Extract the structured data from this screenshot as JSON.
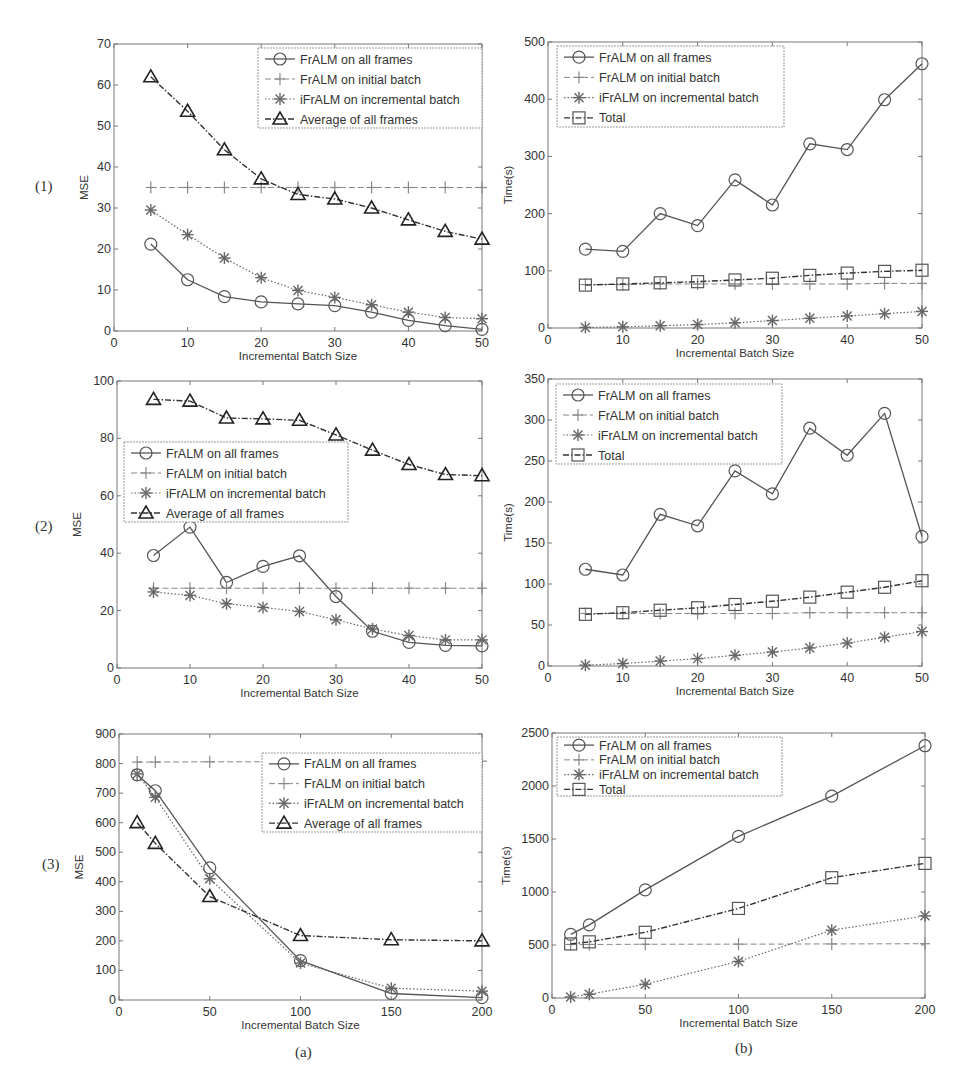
{
  "figure": {
    "row_labels": [
      "(1)",
      "(2)",
      "(3)"
    ],
    "column_labels": [
      "(a)",
      "(b)"
    ]
  },
  "legends": {
    "mse": [
      "FrALM on all frames",
      "FrALM on initial batch",
      "iFrALM on incremental batch",
      "Average of all frames"
    ],
    "time": [
      "FrALM on all frames",
      "FrALM on initial batch",
      "iFrALM on incremental batch",
      "Total"
    ]
  },
  "chart_data": [
    {
      "id": "row1-a",
      "type": "line",
      "title": "",
      "xlabel": "Incremental Batch Size",
      "ylabel": "MSE",
      "xlim": [
        0,
        50
      ],
      "ylim": [
        0,
        70
      ],
      "xticks": [
        0,
        10,
        20,
        30,
        40,
        50
      ],
      "yticks": [
        0,
        10,
        20,
        30,
        40,
        50,
        60,
        70
      ],
      "grid": false,
      "legend_position": "upper right",
      "x": [
        5,
        10,
        15,
        20,
        25,
        30,
        35,
        40,
        45,
        50
      ],
      "series": [
        {
          "name": "FrALM on all frames",
          "marker": "circle",
          "style": "solid",
          "values": [
            21.2,
            12.5,
            8.4,
            7.1,
            6.6,
            6.2,
            4.6,
            2.6,
            1.3,
            0.4
          ]
        },
        {
          "name": "FrALM on initial batch",
          "marker": "plus",
          "style": "dashed",
          "values": [
            35,
            35,
            35,
            35,
            35,
            35,
            35,
            35,
            35,
            35
          ]
        },
        {
          "name": "iFrALM on incremental batch",
          "marker": "star",
          "style": "dotted",
          "values": [
            29.5,
            23.5,
            17.8,
            13.0,
            9.9,
            8.2,
            6.4,
            4.6,
            3.3,
            3.0
          ]
        },
        {
          "name": "Average of all frames",
          "marker": "triangle",
          "style": "dashdot",
          "values": [
            62.0,
            53.6,
            44.2,
            37.1,
            33.3,
            32.2,
            30.0,
            27.1,
            24.3,
            22.4
          ]
        }
      ]
    },
    {
      "id": "row1-b",
      "type": "line",
      "title": "",
      "xlabel": "Incremental Batch Size",
      "ylabel": "Time(s)",
      "xlim": [
        0,
        50
      ],
      "ylim": [
        0,
        500
      ],
      "xticks": [
        0,
        10,
        20,
        30,
        40,
        50
      ],
      "yticks": [
        0,
        100,
        200,
        300,
        400,
        500
      ],
      "grid": false,
      "legend_position": "upper left",
      "x": [
        5,
        10,
        15,
        20,
        25,
        30,
        35,
        40,
        45,
        50
      ],
      "series": [
        {
          "name": "FrALM on all frames",
          "marker": "circle",
          "style": "solid",
          "values": [
            138,
            134,
            200,
            179,
            259,
            215,
            322,
            312,
            399,
            462
          ]
        },
        {
          "name": "FrALM on initial batch",
          "marker": "plus",
          "style": "dashed",
          "values": [
            76,
            76,
            77,
            77,
            77,
            77,
            77,
            77,
            78,
            78
          ]
        },
        {
          "name": "iFrALM on incremental batch",
          "marker": "star",
          "style": "dotted",
          "values": [
            1,
            2,
            4,
            6,
            9,
            13,
            17,
            21,
            25,
            29
          ]
        },
        {
          "name": "Total",
          "marker": "square",
          "style": "dashdot",
          "values": [
            75,
            77,
            79,
            81,
            84,
            87,
            92,
            96,
            99,
            101
          ]
        }
      ]
    },
    {
      "id": "row2-a",
      "type": "line",
      "title": "",
      "xlabel": "Incremental Batch Size",
      "ylabel": "MSE",
      "xlim": [
        0,
        50
      ],
      "ylim": [
        0,
        100
      ],
      "xticks": [
        0,
        10,
        20,
        30,
        40,
        50
      ],
      "yticks": [
        0,
        20,
        40,
        60,
        80,
        100
      ],
      "grid": false,
      "legend_position": "center left",
      "x": [
        5,
        10,
        15,
        20,
        25,
        30,
        35,
        40,
        45,
        50
      ],
      "series": [
        {
          "name": "FrALM on all frames",
          "marker": "circle",
          "style": "solid",
          "values": [
            39.2,
            49.1,
            29.8,
            35.4,
            39.1,
            24.9,
            12.8,
            8.9,
            7.9,
            7.7
          ]
        },
        {
          "name": "FrALM on initial batch",
          "marker": "plus",
          "style": "dashed",
          "values": [
            27.8,
            27.8,
            27.8,
            27.8,
            27.8,
            27.8,
            27.8,
            27.8,
            27.8,
            27.8
          ]
        },
        {
          "name": "iFrALM on incremental batch",
          "marker": "star",
          "style": "dotted",
          "values": [
            26.5,
            25.3,
            22.4,
            21.1,
            19.7,
            16.8,
            13.6,
            11.3,
            9.8,
            9.8
          ]
        },
        {
          "name": "Average of all frames",
          "marker": "triangle",
          "style": "dashdot",
          "values": [
            93.6,
            93.0,
            87.1,
            86.8,
            86.3,
            81.2,
            75.9,
            70.9,
            67.4,
            67.0
          ]
        }
      ]
    },
    {
      "id": "row2-b",
      "type": "line",
      "title": "",
      "xlabel": "Incremental Batch Size",
      "ylabel": "Time(s)",
      "xlim": [
        0,
        50
      ],
      "ylim": [
        0,
        350
      ],
      "xticks": [
        0,
        10,
        20,
        30,
        40,
        50
      ],
      "yticks": [
        0,
        50,
        100,
        150,
        200,
        250,
        300,
        350
      ],
      "grid": false,
      "legend_position": "upper left",
      "x": [
        5,
        10,
        15,
        20,
        25,
        30,
        35,
        40,
        45,
        50
      ],
      "series": [
        {
          "name": "FrALM on all frames",
          "marker": "circle",
          "style": "solid",
          "values": [
            118,
            111,
            185,
            171,
            238,
            210,
            290,
            257,
            308,
            158
          ]
        },
        {
          "name": "FrALM on initial batch",
          "marker": "plus",
          "style": "dashed",
          "values": [
            64,
            64,
            64,
            64,
            64,
            64,
            65,
            65,
            65,
            65
          ]
        },
        {
          "name": "iFrALM on incremental batch",
          "marker": "star",
          "style": "dotted",
          "values": [
            1,
            3,
            6,
            9,
            13,
            17,
            22,
            28,
            35,
            42
          ]
        },
        {
          "name": "Total",
          "marker": "square",
          "style": "dashdot",
          "values": [
            63,
            65,
            68,
            71,
            75,
            79,
            84,
            90,
            96,
            104
          ]
        }
      ]
    },
    {
      "id": "row3-a",
      "type": "line",
      "title": "",
      "xlabel": "Incremental Batch Size",
      "ylabel": "MSE",
      "xlim": [
        0,
        200
      ],
      "ylim": [
        0,
        900
      ],
      "xticks": [
        0,
        50,
        100,
        150,
        200
      ],
      "yticks": [
        0,
        100,
        200,
        300,
        400,
        500,
        600,
        700,
        800,
        900
      ],
      "grid": false,
      "legend_position": "upper right",
      "x": [
        10,
        20,
        50,
        100,
        150,
        200
      ],
      "series": [
        {
          "name": "FrALM on all frames",
          "marker": "circle",
          "style": "solid",
          "values": [
            762,
            708,
            447,
            133,
            22,
            8
          ]
        },
        {
          "name": "FrALM on initial batch",
          "marker": "plus",
          "style": "dashed",
          "values": [
            805,
            805,
            806,
            806,
            807,
            808
          ]
        },
        {
          "name": "iFrALM on incremental batch",
          "marker": "star",
          "style": "dotted",
          "values": [
            765,
            686,
            410,
            125,
            40,
            30
          ]
        },
        {
          "name": "Average of all frames",
          "marker": "triangle",
          "style": "dashdot",
          "values": [
            600,
            530,
            350,
            218,
            204,
            200
          ]
        }
      ]
    },
    {
      "id": "row3-b",
      "type": "line",
      "title": "",
      "xlabel": "Incremental Batch Size",
      "ylabel": "Time(s)",
      "xlim": [
        0,
        200
      ],
      "ylim": [
        0,
        2500
      ],
      "xticks": [
        0,
        50,
        100,
        150,
        200
      ],
      "yticks": [
        0,
        500,
        1000,
        1500,
        2000,
        2500
      ],
      "grid": false,
      "legend_position": "upper left",
      "x": [
        10,
        20,
        50,
        100,
        150,
        200
      ],
      "series": [
        {
          "name": "FrALM on all frames",
          "marker": "circle",
          "style": "solid",
          "values": [
            600,
            690,
            1020,
            1525,
            1905,
            2380
          ]
        },
        {
          "name": "FrALM on initial batch",
          "marker": "plus",
          "style": "dashed",
          "values": [
            505,
            505,
            507,
            508,
            510,
            512
          ]
        },
        {
          "name": "iFrALM on incremental batch",
          "marker": "star",
          "style": "dotted",
          "values": [
            10,
            35,
            130,
            345,
            640,
            775
          ]
        },
        {
          "name": "Total",
          "marker": "square",
          "style": "dashdot",
          "values": [
            510,
            530,
            620,
            845,
            1135,
            1270
          ]
        }
      ]
    }
  ]
}
